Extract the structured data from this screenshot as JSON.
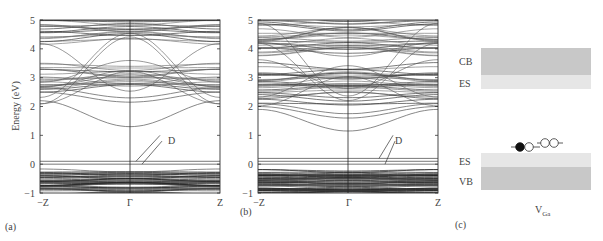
{
  "figure": {
    "panels": [
      {
        "id": "a",
        "label": "(a)"
      },
      {
        "id": "b",
        "label": "(b)"
      },
      {
        "id": "c",
        "label": "(c)"
      }
    ]
  },
  "chart_data": [
    {
      "type": "line",
      "panel": "(a)",
      "title": "",
      "xlabel": "",
      "ylabel": "Energy (eV)",
      "x_ticks": [
        "−Z",
        "Γ",
        "Z"
      ],
      "y_ticks": [
        -1,
        0,
        1,
        2,
        3,
        4,
        5
      ],
      "ylim": [
        -1,
        5
      ],
      "annotation": "D",
      "key_bands": {
        "defect_levels_eV": [
          0.0,
          0.1
        ],
        "cbm_at_gamma_eV": 1.3,
        "lowest_cb_at_zone_edge_eV": 2.2,
        "valence_band_region_eV": [
          -1.0,
          -0.25
        ],
        "dense_cb_regions_eV": [
          [
            2.7,
            3.4
          ],
          [
            4.3,
            5.0
          ]
        ]
      }
    },
    {
      "type": "line",
      "panel": "(b)",
      "title": "",
      "xlabel": "",
      "ylabel": "",
      "x_ticks": [
        "−Z",
        "Γ",
        "Z"
      ],
      "y_ticks": [
        -1,
        0,
        1,
        2,
        3,
        4,
        5
      ],
      "ylim": [
        -1,
        5
      ],
      "annotation": "D",
      "key_bands": {
        "defect_levels_eV": [
          0.0,
          0.1,
          0.2
        ],
        "cbm_at_gamma_eV": 1.15,
        "lowest_cb_at_zone_edge_eV": 1.9,
        "valence_band_region_eV": [
          -1.0,
          -0.2
        ],
        "dense_cb_regions_eV": [
          [
            2.0,
            3.3
          ],
          [
            3.7,
            5.0
          ]
        ]
      }
    },
    {
      "type": "diagram",
      "panel": "(c)",
      "bands": [
        {
          "label": "CB",
          "shade": "dark"
        },
        {
          "label": "ES",
          "shade": "light"
        },
        {
          "label": "ES",
          "shade": "light"
        },
        {
          "label": "VB",
          "shade": "dark"
        }
      ],
      "defect_label": "V",
      "defect_subscript": "Ga",
      "levels": [
        {
          "electrons": [
            "filled",
            "empty"
          ]
        },
        {
          "electrons": [
            "empty",
            "empty"
          ]
        }
      ]
    }
  ],
  "text": {
    "ylabel": "Energy (eV)",
    "xtick_left": "−Z",
    "xtick_mid": "Γ",
    "xtick_right": "Z",
    "annotation_d": "D",
    "cb": "CB",
    "es_top": "ES",
    "es_bottom": "ES",
    "vb": "VB",
    "vga_main": "V",
    "vga_sub": "Ga",
    "label_a": "(a)",
    "label_b": "(b)",
    "label_c": "(c)"
  }
}
